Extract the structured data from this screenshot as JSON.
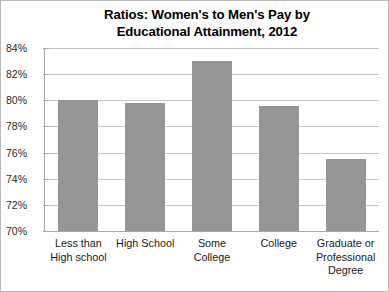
{
  "chart_data": {
    "type": "bar",
    "title": "Ratios: Women's to Men's Pay by Educational Attainment, 2012",
    "title_lines": [
      "Ratios: Women's to Men's Pay by",
      "Educational Attainment, 2012"
    ],
    "xlabel": "",
    "ylabel": "",
    "categories": [
      "Less than High school",
      "High School",
      "Some College",
      "College",
      "Graduate or Professional Degree"
    ],
    "category_lines": [
      [
        "Less than",
        "High school"
      ],
      [
        "High School"
      ],
      [
        "Some",
        "College"
      ],
      [
        "College"
      ],
      [
        "Graduate or",
        "Professional",
        "Degree"
      ]
    ],
    "values": [
      80.0,
      79.8,
      83.0,
      79.6,
      75.5
    ],
    "value_labels": [
      "80%",
      "79.8%",
      "83%",
      "79.6%",
      "75.5%"
    ],
    "ylim": [
      70,
      84
    ],
    "ytick_values": [
      84,
      82,
      80,
      78,
      76,
      74,
      72,
      70
    ],
    "ytick_labels": [
      "84%",
      "82%",
      "80%",
      "78%",
      "76%",
      "74%",
      "72%",
      "70%"
    ],
    "grid": true,
    "legend": false,
    "legend_position": "none",
    "units": "percent",
    "bar_color": "#969696",
    "gridline_color": "#c4c4c4",
    "axis_color": "#a8a8a8",
    "plot_background": "#ffffff",
    "border_color": "#b9b9b9"
  }
}
